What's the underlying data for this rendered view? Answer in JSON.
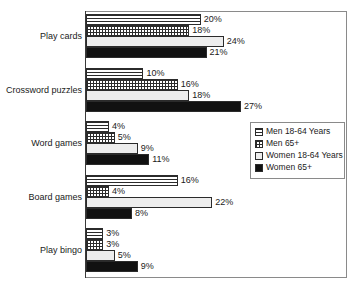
{
  "chart_data": {
    "type": "bar",
    "orientation": "horizontal",
    "title": "",
    "subtitle": "",
    "xlabel": "",
    "ylabel": "",
    "xlim": [
      0,
      45
    ],
    "grid": false,
    "legend_position": "middle-right",
    "value_suffix": "%",
    "categories": [
      "Play cards",
      "Crossword puzzles",
      "Word games",
      "Board games",
      "Play bingo"
    ],
    "series": [
      {
        "name": "Men 18-64 Years",
        "pattern": "horizontal-lines",
        "values": [
          20,
          10,
          4,
          16,
          3
        ],
        "labels": [
          "20%",
          "10%",
          "4%",
          "16%",
          "3%"
        ]
      },
      {
        "name": "Men 65+",
        "pattern": "crosshatch-grid",
        "values": [
          18,
          16,
          5,
          4,
          3
        ],
        "labels": [
          "18%",
          "16%",
          "5%",
          "4%",
          "3%"
        ]
      },
      {
        "name": "Women 18-64 Years",
        "pattern": "light-empty",
        "values": [
          24,
          18,
          9,
          22,
          5
        ],
        "labels": [
          "24%",
          "18%",
          "9%",
          "22%",
          "5%"
        ]
      },
      {
        "name": "Women 65+",
        "pattern": "solid-black",
        "values": [
          21,
          27,
          11,
          8,
          9
        ],
        "labels": [
          "21%",
          "27%",
          "11%",
          "8%",
          "9%"
        ]
      }
    ]
  },
  "legend": {
    "items": [
      {
        "label": "Men 18-64 Years",
        "pattern": "horizontal-lines"
      },
      {
        "label": "Men 65+",
        "pattern": "crosshatch-grid"
      },
      {
        "label": "Women 18-64 Years",
        "pattern": "light-empty"
      },
      {
        "label": "Women 65+",
        "pattern": "solid-black"
      }
    ]
  },
  "colors": {
    "frame": "#8a8a8a",
    "axis": "#3a3a3a",
    "bar_outline": "#2b2b2b",
    "solid_fill": "#111111",
    "light_fill": "#ededed",
    "text": "#1a1a1a",
    "background": "#ffffff"
  }
}
